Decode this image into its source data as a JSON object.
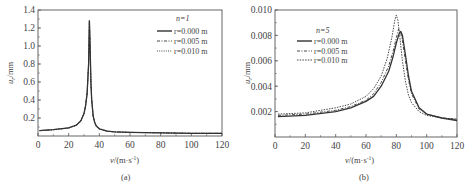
{
  "chart_data": [
    {
      "panel": "(a)",
      "type": "line",
      "xlabel": "v/(m·s⁻¹)",
      "ylabel": "u_r/mm",
      "xlim": [
        0,
        120
      ],
      "ylim": [
        0,
        1.4
      ],
      "xticks": [
        "0",
        "20",
        "40",
        "60",
        "80",
        "100",
        "120"
      ],
      "yticks": [
        "0.2",
        "0.4",
        "0.6",
        "0.8",
        "1.0",
        "1.2",
        "1.4"
      ],
      "legend_title": "n=1",
      "legend_position": "upper right",
      "series": [
        {
          "name": "r=0.000 m",
          "style": "solid",
          "x": [
            1,
            10,
            20,
            25,
            28,
            30,
            31,
            32,
            33,
            33.5,
            34,
            34.5,
            35,
            36,
            37,
            38,
            40,
            45,
            50,
            60,
            80,
            100,
            120
          ],
          "y": [
            0.06,
            0.07,
            0.09,
            0.12,
            0.17,
            0.25,
            0.33,
            0.47,
            0.8,
            1.28,
            1.0,
            0.6,
            0.4,
            0.22,
            0.15,
            0.11,
            0.08,
            0.055,
            0.045,
            0.04,
            0.035,
            0.03,
            0.03
          ]
        },
        {
          "name": "r=0.005 m",
          "style": "dashdot",
          "x": [
            1,
            10,
            20,
            25,
            28,
            30,
            31,
            32,
            33,
            33.5,
            34,
            34.5,
            35,
            36,
            37,
            38,
            40,
            45,
            50,
            60,
            80,
            100,
            120
          ],
          "y": [
            0.06,
            0.07,
            0.09,
            0.12,
            0.17,
            0.25,
            0.33,
            0.47,
            0.8,
            1.28,
            1.0,
            0.6,
            0.4,
            0.22,
            0.15,
            0.11,
            0.08,
            0.055,
            0.045,
            0.04,
            0.035,
            0.03,
            0.03
          ]
        },
        {
          "name": "r=0.010 m",
          "style": "dotted",
          "x": [
            1,
            10,
            20,
            25,
            28,
            30,
            31,
            32,
            33,
            33.5,
            34,
            34.5,
            35,
            36,
            37,
            38,
            40,
            45,
            50,
            60,
            80,
            100,
            120
          ],
          "y": [
            0.06,
            0.07,
            0.09,
            0.12,
            0.17,
            0.25,
            0.33,
            0.47,
            0.8,
            1.28,
            1.0,
            0.6,
            0.4,
            0.22,
            0.15,
            0.11,
            0.08,
            0.055,
            0.045,
            0.04,
            0.035,
            0.03,
            0.03
          ]
        }
      ],
      "caption": "(a)"
    },
    {
      "panel": "(b)",
      "type": "line",
      "xlabel": "v/(m·s⁻¹)",
      "ylabel": "u_r/mm",
      "xlim": [
        0,
        120
      ],
      "ylim": [
        0,
        0.01
      ],
      "xticks": [
        "0",
        "20",
        "40",
        "60",
        "80",
        "100",
        "120"
      ],
      "yticks": [
        "0.002",
        "0.004",
        "0.006",
        "0.008",
        "0.010"
      ],
      "legend_title": "n=5",
      "legend_position": "upper left",
      "series": [
        {
          "name": "r=0.000 m",
          "style": "solid",
          "x": [
            2,
            20,
            40,
            50,
            60,
            65,
            70,
            75,
            78,
            80,
            82,
            83,
            84,
            86,
            88,
            90,
            95,
            100,
            110,
            120
          ],
          "y": [
            0.0016,
            0.0017,
            0.002,
            0.0023,
            0.0028,
            0.0032,
            0.004,
            0.0052,
            0.0064,
            0.0074,
            0.0082,
            0.0083,
            0.008,
            0.0065,
            0.0048,
            0.0036,
            0.0023,
            0.0018,
            0.0015,
            0.0013
          ]
        },
        {
          "name": "r=0.005 m",
          "style": "dashdot",
          "x": [
            2,
            20,
            40,
            50,
            60,
            65,
            70,
            75,
            78,
            80,
            81.5,
            82.5,
            84,
            86,
            88,
            90,
            95,
            100,
            110,
            120
          ],
          "y": [
            0.0017,
            0.0018,
            0.0021,
            0.0024,
            0.0029,
            0.0034,
            0.0043,
            0.0056,
            0.0068,
            0.0078,
            0.0085,
            0.0084,
            0.0076,
            0.006,
            0.0045,
            0.0034,
            0.0022,
            0.0018,
            0.0015,
            0.0014
          ]
        },
        {
          "name": "r=0.010 m",
          "style": "dotted",
          "x": [
            2,
            20,
            40,
            50,
            60,
            65,
            70,
            74,
            77,
            79,
            80,
            81,
            82,
            84,
            86,
            88,
            90,
            95,
            100,
            110,
            120
          ],
          "y": [
            0.0018,
            0.0019,
            0.0023,
            0.0026,
            0.0032,
            0.0038,
            0.0048,
            0.0062,
            0.0078,
            0.0092,
            0.0096,
            0.0092,
            0.0082,
            0.006,
            0.0044,
            0.0033,
            0.0027,
            0.002,
            0.0017,
            0.0015,
            0.0014
          ]
        }
      ],
      "caption": "(b)"
    }
  ],
  "panels": [
    {
      "ylabel_main": "u",
      "ylabel_sub": "r",
      "ylabel_unit": "/mm",
      "xlabel_main": "v",
      "xlabel_unit": "/(m·s",
      "xlabel_sup": "-1",
      "xlabel_close": ")",
      "caption": "(a)",
      "yticks": [
        "0.2",
        "0.4",
        "0.6",
        "0.8",
        "1.0",
        "1.2",
        "1.4"
      ],
      "xticks": [
        "0",
        "20",
        "40",
        "60",
        "80",
        "100",
        "120"
      ],
      "legend": {
        "title": "n=1",
        "items": [
          "r=0.000 m",
          "r=0.005 m",
          "r=0.010 m"
        ]
      }
    },
    {
      "ylabel_main": "u",
      "ylabel_sub": "r",
      "ylabel_unit": "/mm",
      "xlabel_main": "v",
      "xlabel_unit": "/(m·s",
      "xlabel_sup": "-1",
      "xlabel_close": ")",
      "caption": "(b)",
      "yticks": [
        "0.002",
        "0.004",
        "0.006",
        "0.008",
        "0.010"
      ],
      "xticks": [
        "0",
        "20",
        "40",
        "60",
        "80",
        "100",
        "120"
      ],
      "legend": {
        "title": "n=5",
        "items": [
          "r=0.000 m",
          "r=0.005 m",
          "r=0.010 m"
        ]
      }
    }
  ],
  "colors": {
    "line": "#333333",
    "axis": "#555555",
    "text": "#444444"
  }
}
